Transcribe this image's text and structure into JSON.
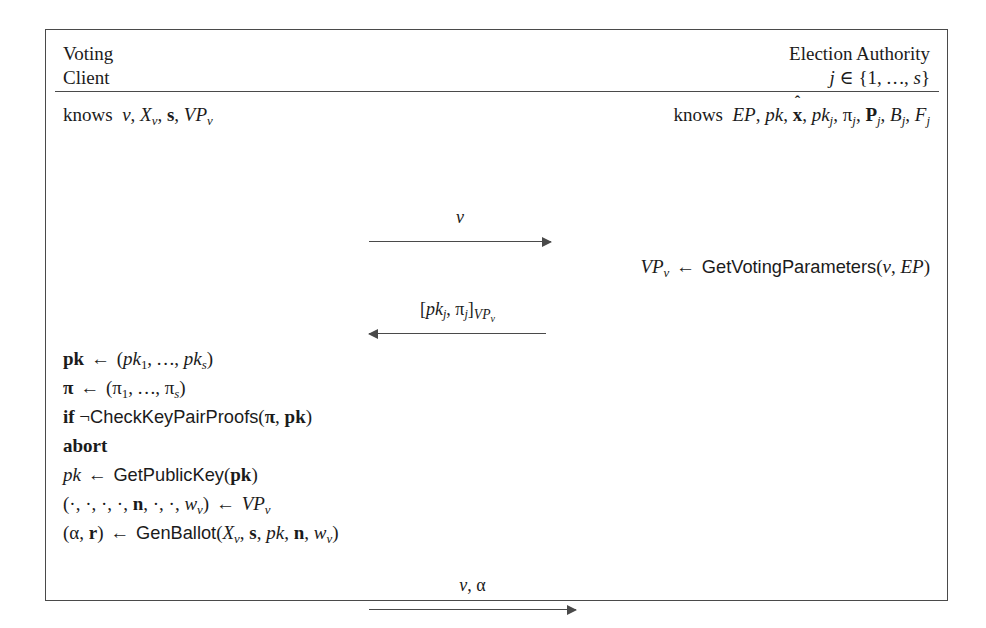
{
  "figure": {
    "kind": "protocol-sequence-diagram",
    "frame_color": "#4a4a4a",
    "background": "#ffffff"
  },
  "parties": {
    "left": {
      "name_line1": "Voting",
      "name_line2": "Client",
      "knows_label": "knows",
      "knows_items": "v, X_v, s, VP_v"
    },
    "right": {
      "name_line1": "Election Authority",
      "name_line2": "j ∈ {1, … , s}",
      "knows_label": "knows",
      "knows_items": "EP, pk, x̂, pk_j, π_j, P_j, B_j, F_j"
    }
  },
  "messages": [
    {
      "id": "vote",
      "label": "v",
      "direction": "right",
      "from": "Voting Client",
      "to": "Election Authority"
    },
    {
      "id": "keys",
      "label": "[pk_j, π_j]_{VP_v}",
      "direction": "left",
      "from": "Election Authority",
      "to": "Voting Client"
    },
    {
      "id": "ballot",
      "label": "v, α",
      "direction": "right",
      "from": "Voting Client",
      "to": "Election Authority"
    }
  ],
  "ea_computation": [
    {
      "id": "get-voting-parameters",
      "text": "VP_v ← GetVotingParameters(v, EP)",
      "function": "GetVotingParameters"
    }
  ],
  "client_computation": [
    {
      "id": "collect-pk",
      "text": "pk ← (pk_1, … , pk_s)",
      "function": ""
    },
    {
      "id": "collect-pi",
      "text": "π ← (π_1, … , π_s)",
      "function": ""
    },
    {
      "id": "check-key-proofs",
      "text": "if ¬CheckKeyPairProofs(π, pk)",
      "function": "CheckKeyPairProofs"
    },
    {
      "id": "abort",
      "text": "abort",
      "function": ""
    },
    {
      "id": "get-public-key",
      "text": "pk ← GetPublicKey(pk)",
      "function": "GetPublicKey"
    },
    {
      "id": "destructure-vp",
      "text": "(·, ·, ·, ·, n, ·, ·, w_v) ← VP_v",
      "function": ""
    },
    {
      "id": "gen-ballot",
      "text": "(α, r) ← GenBallot(X_v, s, pk, n, w_v)",
      "function": "GenBallot"
    }
  ]
}
